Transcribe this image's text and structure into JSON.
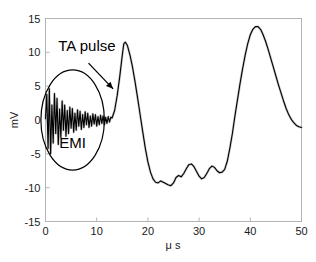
{
  "chart_data": {
    "type": "line",
    "title": "",
    "xlabel": "μ s",
    "ylabel": "mV",
    "xlim": [
      0,
      50
    ],
    "ylim": [
      -15,
      15
    ],
    "xticks": [
      0,
      10,
      20,
      30,
      40,
      50
    ],
    "yticks": [
      15,
      10,
      5,
      0,
      -5,
      -10,
      -15
    ],
    "xtick_labels": [
      "0",
      "10",
      "20",
      "30",
      "40",
      "50"
    ],
    "ytick_labels": [
      "15",
      "10",
      "5",
      "0",
      "-5",
      "-10",
      "-15"
    ],
    "grid": false,
    "legend": null,
    "series": [
      {
        "name": "signal",
        "color": "#000000",
        "description": "Electromagnetic interference noise burst followed by thermoacoustic pulse oscillation",
        "x": [
          0.0,
          0.25,
          0.5,
          0.75,
          1.0,
          1.25,
          1.5,
          1.75,
          2.0,
          2.25,
          2.5,
          2.75,
          3.0,
          3.25,
          3.5,
          3.75,
          4.0,
          4.25,
          4.5,
          4.75,
          5.0,
          5.25,
          5.5,
          5.75,
          6.0,
          6.25,
          6.5,
          6.75,
          7.0,
          7.25,
          7.5,
          7.75,
          8.0,
          8.25,
          8.5,
          8.75,
          9.0,
          9.25,
          9.5,
          9.75,
          10.0,
          10.25,
          10.5,
          10.75,
          11.0,
          11.25,
          11.5,
          11.75,
          12.0,
          12.25,
          12.5,
          12.75,
          13.0,
          13.5,
          14.0,
          14.5,
          15.0,
          15.3,
          15.6,
          16.0,
          16.5,
          17.0,
          17.5,
          18.0,
          18.5,
          19.0,
          19.5,
          20.0,
          20.5,
          21.0,
          21.5,
          22.0,
          22.5,
          23.0,
          23.5,
          24.0,
          24.5,
          25.0,
          25.5,
          26.0,
          26.5,
          27.0,
          27.5,
          28.0,
          28.5,
          29.0,
          29.5,
          30.0,
          30.5,
          31.0,
          31.5,
          32.0,
          32.5,
          33.0,
          33.5,
          34.0,
          34.5,
          35.0,
          35.5,
          36.0,
          36.5,
          37.0,
          37.5,
          38.0,
          38.5,
          39.0,
          39.5,
          40.0,
          40.5,
          41.0,
          41.5,
          42.0,
          42.5,
          43.0,
          43.5,
          44.0,
          44.5,
          45.0,
          45.5,
          46.0,
          46.5,
          47.0,
          47.5,
          48.0,
          48.5,
          49.0,
          49.5,
          50.0
        ],
        "y": [
          0.2,
          3.8,
          -4.2,
          4.6,
          -5.0,
          2.2,
          -3.4,
          3.9,
          -2.0,
          3.2,
          -3.6,
          1.6,
          -2.6,
          2.8,
          -1.5,
          2.2,
          -2.4,
          1.4,
          -2.0,
          1.9,
          -1.2,
          1.7,
          -1.8,
          1.0,
          -1.5,
          1.5,
          -0.9,
          1.3,
          -1.4,
          0.8,
          -1.1,
          1.2,
          -0.7,
          1.0,
          -1.1,
          0.6,
          -0.9,
          0.9,
          -0.6,
          0.8,
          -0.9,
          0.5,
          -0.7,
          0.7,
          -0.5,
          0.6,
          -0.7,
          0.4,
          -0.5,
          0.5,
          -0.3,
          0.4,
          0.3,
          1.4,
          3.6,
          6.4,
          9.6,
          11.3,
          11.5,
          11.0,
          9.6,
          7.8,
          5.6,
          3.2,
          0.7,
          -1.8,
          -4.2,
          -6.2,
          -7.7,
          -8.7,
          -9.2,
          -9.3,
          -9.0,
          -9.2,
          -9.4,
          -9.6,
          -9.7,
          -9.3,
          -8.5,
          -8.2,
          -8.4,
          -7.9,
          -7.2,
          -6.6,
          -6.5,
          -6.9,
          -7.6,
          -8.3,
          -8.7,
          -8.5,
          -7.9,
          -7.2,
          -6.8,
          -7.0,
          -7.5,
          -7.8,
          -7.7,
          -7.3,
          -6.1,
          -4.2,
          -2.0,
          0.6,
          3.0,
          5.4,
          7.6,
          9.6,
          11.3,
          12.6,
          13.4,
          13.8,
          13.8,
          13.4,
          12.6,
          11.6,
          10.4,
          9.1,
          7.8,
          6.5,
          5.2,
          4.0,
          2.8,
          1.7,
          0.8,
          0.1,
          -0.4,
          -0.8,
          -1.0,
          -1.1
        ]
      }
    ],
    "annotations": [
      {
        "name": "ta-pulse",
        "text": "TA pulse",
        "text_x": 2.5,
        "text_y": 10.2,
        "arrow_from_x": 8.4,
        "arrow_from_y": 8.4,
        "arrow_to_x": 13.2,
        "arrow_to_y": 4.6
      },
      {
        "name": "emi",
        "text": "EMI",
        "text_x": 5.3,
        "text_y": -4.2,
        "ellipse_cx": 5.3,
        "ellipse_cy": 0.0,
        "ellipse_rx": 6.2,
        "ellipse_ry": 7.4
      }
    ]
  },
  "axes": {
    "x_label": "μ s",
    "y_label": "mV"
  }
}
